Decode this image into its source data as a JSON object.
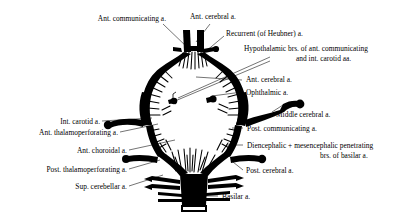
{
  "figure": {
    "background_color": "#ffffff",
    "ink_color": "#000000",
    "width": 410,
    "height": 218
  },
  "labels": {
    "ant_communicating": "Ant. communicating a.",
    "ant_cerebral_top": "Ant. cerebral a.",
    "recurrent_heubner": "Recurrent (of Heubner) a.",
    "hypothalamic_line1": "Hypothalamic brs. of ant. communicating",
    "hypothalamic_line2": "and int. carotid aa.",
    "ant_cerebral_right": "Ant. cerebral a.",
    "ophthalmic": "Ophthalmic a.",
    "middle_cerebral": "Middle cerebral a.",
    "post_communicating": "Post. communicating a.",
    "diencephalic_line1": "Diencephalic + mesencephalic penetrating",
    "diencephalic_line2": "brs. of basilar a.",
    "post_cerebral": "Post. cerebral a.",
    "int_carotid": "Int. carotid a.",
    "ant_thalamoperforating": "Ant. thalamoperforating a.",
    "ant_choroidal": "Ant. choroidal a.",
    "post_thalamoperforating": "Post. thalamoperforating a.",
    "sup_cerebellar": "Sup. cerebellar a.",
    "basilar": "Basilar a."
  }
}
